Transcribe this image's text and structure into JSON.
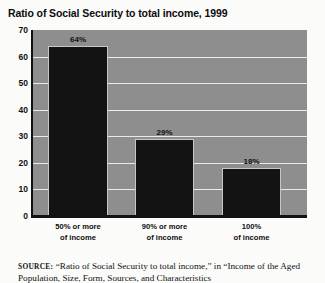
{
  "chart_data": {
    "type": "bar",
    "title": "Ratio of Social Security to total income, 1999",
    "xlabel": "",
    "ylabel": "",
    "ylim": [
      0,
      70
    ],
    "yticks": [
      0,
      10,
      20,
      30,
      40,
      50,
      60,
      70
    ],
    "grid": true,
    "legend": "none",
    "categories": [
      "50% or more of income",
      "90% or more of income",
      "100% of income"
    ],
    "category_lines": [
      [
        "50% or more",
        "of income"
      ],
      [
        "90% or more",
        "of income"
      ],
      [
        "100%",
        "of income"
      ]
    ],
    "values": [
      64,
      29,
      18
    ],
    "data_labels": [
      "64%",
      "29%",
      "18%"
    ],
    "colors": {
      "bar": "#131313",
      "plot_background": "#8e8e8e",
      "gridline": "#eceae6",
      "axis": "#111111",
      "page_background": "#ffffff",
      "text": "#111111"
    }
  },
  "source": {
    "label": "SOURCE:",
    "line1": "“Ratio of Social Security to total income,” in “Income of the",
    "line2": "Aged Population, Size, Form, Sources, and Characteristics"
  }
}
